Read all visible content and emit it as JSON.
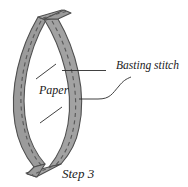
{
  "figure": {
    "caption": "Step 3",
    "labels": {
      "basting_stitch": "Basting stitch",
      "paper": "Paper"
    },
    "colors": {
      "background": "#ffffff",
      "fabric_strip_fill": "#9b9b9b",
      "fabric_strip_fill_light": "#a8a8a8",
      "outline": "#4a4a4a",
      "stitch_dash": "#5a5a5a",
      "leader_line": "#2b2b2b",
      "text": "#1a1a1a"
    },
    "shapes": {
      "description": "Lens / leaf shaped paper piece with two curved fabric strips crossing at the top and bottom tips, each strip marked with a dashed basting stitch line.",
      "left_strip_name": "curved-fabric-strip-left",
      "right_strip_name": "curved-fabric-strip-right",
      "top_tail_name": "fabric-tail-top",
      "bottom_tail_name": "fabric-tail-bottom",
      "paper_region_name": "paper-interior-region"
    },
    "leaders": {
      "basting_upper": "horizontal leader from paper area across right strip",
      "basting_lower": "curved S leader from right strip to Basting stitch label",
      "paper_upper_tick": "short diagonal tick above Paper label",
      "paper_lower_tick": "short diagonal tick below Paper label"
    }
  }
}
